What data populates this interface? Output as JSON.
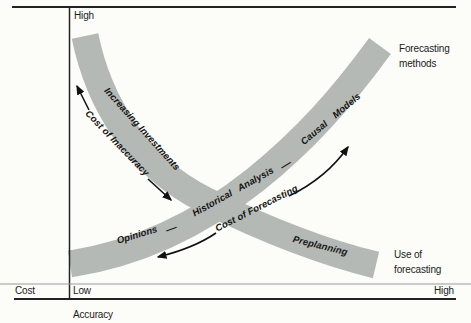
{
  "diagram": {
    "y_axis": {
      "label": "Cost",
      "top_tick": "High"
    },
    "x_axis": {
      "label": "Accuracy",
      "left_tick": "Low",
      "right_tick": "High"
    },
    "separator": "—",
    "forecasting_band": {
      "method_first": "Opinions",
      "method_second": "Historical Analysis",
      "method_third": "Causal Models",
      "cost_arrow_label": "Cost of Forecasting",
      "end_label": "Forecasting methods"
    },
    "investment_band": {
      "upper_label": "Increasing Investments",
      "cost_arrow_label": "Cost of Inaccuracy",
      "lower_label": "Preplanning",
      "end_label": "Use of forecasting"
    },
    "colors": {
      "band": "#b5b9b6",
      "line": "#222222",
      "arrow": "#111111",
      "background": "#fcfcf9"
    }
  }
}
